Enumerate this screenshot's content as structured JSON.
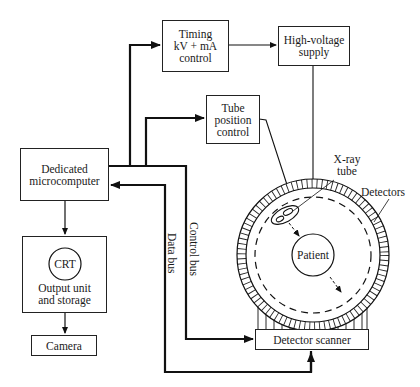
{
  "diagram": {
    "type": "block-diagram",
    "blocks": {
      "timing": {
        "lines": [
          "Timing",
          "kV + mA",
          "control"
        ]
      },
      "high_voltage": {
        "lines": [
          "High-voltage",
          "supply"
        ]
      },
      "tube_position": {
        "lines": [
          "Tube",
          "position",
          "control"
        ]
      },
      "microcomputer": {
        "lines": [
          "Dedicated",
          "microcomputer"
        ]
      },
      "output_unit": {
        "crt": "CRT",
        "lines": [
          "Output unit",
          "and storage"
        ]
      },
      "camera": {
        "label": "Camera"
      },
      "detector_scanner": {
        "label": "Detector scanner"
      }
    },
    "gantry": {
      "xray_tube": {
        "lines": [
          "X-ray",
          "tube"
        ]
      },
      "detectors": "Detectors",
      "patient": "Patient"
    },
    "buses": {
      "data_bus": "Data bus",
      "control_bus": "Control bus"
    },
    "connections": [
      {
        "from": "Dedicated microcomputer",
        "to": "Timing kV + mA control"
      },
      {
        "from": "Dedicated microcomputer",
        "to": "Tube position control"
      },
      {
        "from": "Timing kV + mA control",
        "to": "High-voltage supply"
      },
      {
        "from": "High-voltage supply",
        "to": "X-ray tube"
      },
      {
        "from": "Tube position control",
        "to": "X-ray tube"
      },
      {
        "from": "Dedicated microcomputer",
        "to": "Output unit and storage"
      },
      {
        "from": "Output unit and storage",
        "to": "Camera"
      },
      {
        "from": "Dedicated microcomputer",
        "to": "Detector scanner",
        "via": "Control bus"
      },
      {
        "from": "Detector scanner",
        "to": "Dedicated microcomputer",
        "via": "Data bus"
      },
      {
        "from": "Detectors",
        "to": "Detector scanner"
      }
    ]
  }
}
